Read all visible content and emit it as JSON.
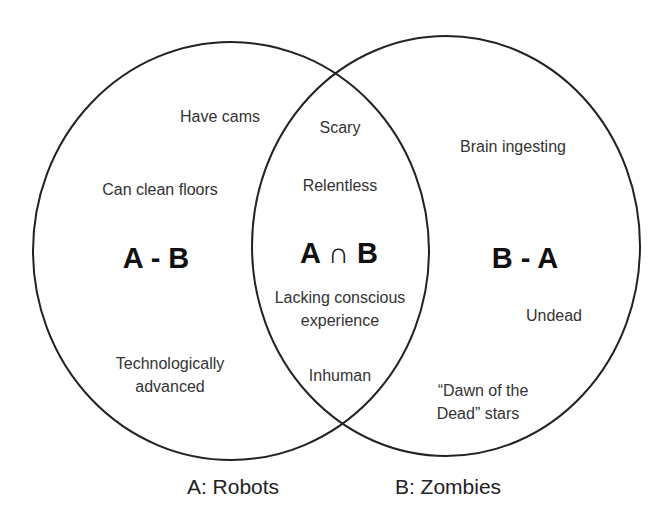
{
  "diagram": {
    "type": "venn",
    "sets": {
      "a": {
        "label": "A: Robots"
      },
      "b": {
        "label": "B: Zombies"
      }
    },
    "regions": {
      "a_minus_b": {
        "title": "A - B",
        "items": [
          "Have cams",
          "Can clean floors",
          "Technologically",
          "advanced"
        ]
      },
      "intersection": {
        "title": "A ∩ B",
        "items": [
          "Scary",
          "Relentless",
          "Lacking conscious",
          "experience",
          "Inhuman"
        ]
      },
      "b_minus_a": {
        "title": "B - A",
        "items": [
          "Brain ingesting",
          "Undead",
          "“Dawn of the",
          "Dead” stars"
        ]
      }
    },
    "colors": {
      "stroke": "#222222",
      "text": "#333333",
      "background": "#ffffff"
    }
  }
}
